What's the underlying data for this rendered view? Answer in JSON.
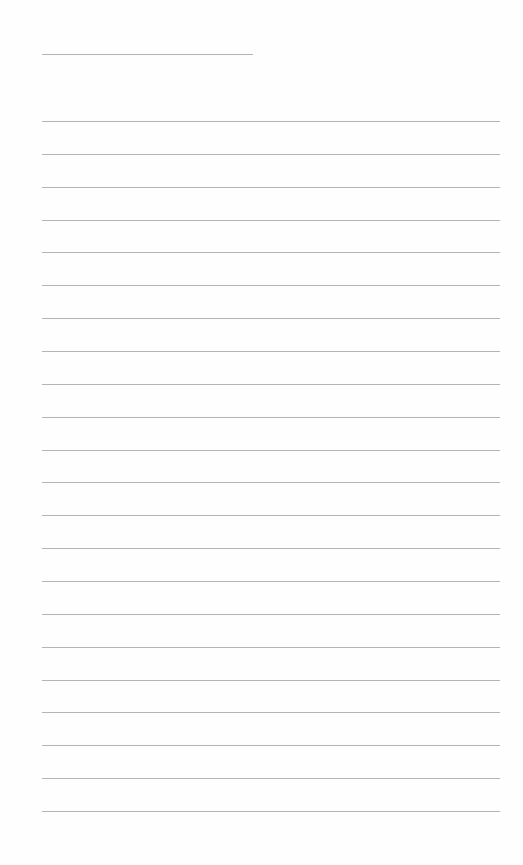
{
  "page": {
    "type": "lined-paper",
    "background_color": "#fefefe",
    "line_color": "#b4b4b4",
    "title_line": {
      "x": 42,
      "y": 54,
      "width": 211
    },
    "body_lines": {
      "x": 42,
      "width": 458,
      "first_y": 121,
      "spacing": 32.86,
      "count": 22
    }
  }
}
